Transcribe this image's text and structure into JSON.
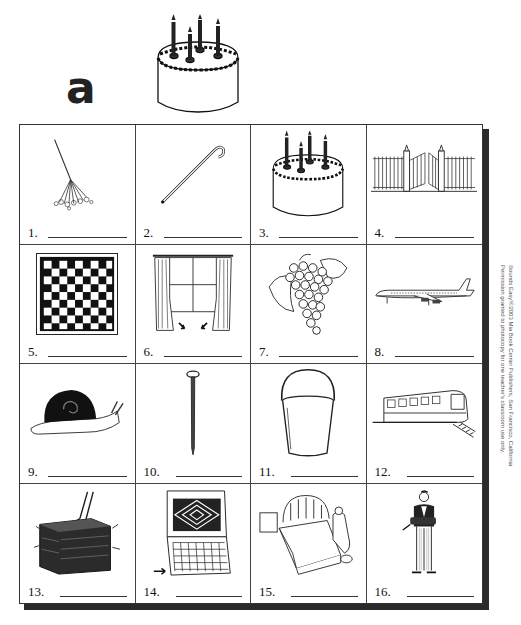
{
  "header": {
    "letter": "a",
    "picture": "birthday-cake"
  },
  "worksheet": {
    "items": [
      {
        "number": "1.",
        "picture": "rake"
      },
      {
        "number": "2.",
        "picture": "cane"
      },
      {
        "number": "3.",
        "picture": "cake"
      },
      {
        "number": "4.",
        "picture": "gate"
      },
      {
        "number": "5.",
        "picture": "checkerboard"
      },
      {
        "number": "6.",
        "picture": "window-drapes"
      },
      {
        "number": "7.",
        "picture": "grapes"
      },
      {
        "number": "8.",
        "picture": "airplane"
      },
      {
        "number": "9.",
        "picture": "snail"
      },
      {
        "number": "10.",
        "picture": "nail"
      },
      {
        "number": "11.",
        "picture": "pail"
      },
      {
        "number": "12.",
        "picture": "train"
      },
      {
        "number": "13.",
        "picture": "hay-bale"
      },
      {
        "number": "14.",
        "picture": "calendar-date"
      },
      {
        "number": "15.",
        "picture": "bed-praying"
      },
      {
        "number": "16.",
        "picture": "waiter-tray"
      }
    ]
  },
  "credit": {
    "line1": "Sounds Easy!©2003 Mia Book Center Publishers, San Francisco, California",
    "line2": "Permission granted to photocopy for one teacher's classroom use only."
  }
}
